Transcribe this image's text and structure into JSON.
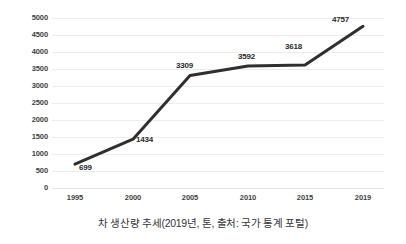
{
  "chart_data": {
    "type": "line",
    "title": "",
    "caption": "차 생산량 추세(2019년, 톤, 출처: 국가 통계 포털)",
    "xlabel": "",
    "ylabel": "",
    "categories": [
      "1995",
      "2000",
      "2005",
      "2010",
      "2015",
      "2019"
    ],
    "values": [
      699,
      1434,
      3309,
      3592,
      3618,
      4757
    ],
    "point_labels": [
      "699",
      "1434",
      "3309",
      "3592",
      "3618",
      "4757"
    ],
    "ylim": [
      0,
      5000
    ],
    "ytick_labels": [
      "5000",
      "4500",
      "4000",
      "3500",
      "3000",
      "2500",
      "2000",
      "1500",
      "1000",
      "500",
      "0"
    ],
    "ytick_values": [
      5000,
      4500,
      4000,
      3500,
      3000,
      2500,
      2000,
      1500,
      1000,
      500,
      0
    ],
    "grid": true,
    "legend": "none",
    "series": [
      {
        "name": "차 생산량",
        "values": [
          699,
          1434,
          3309,
          3592,
          3618,
          4757
        ],
        "color": "#2f2f2f"
      }
    ],
    "colors": {
      "line": "#2f2f2f",
      "grid": "#ececec",
      "text": "#3f3f3f",
      "background": "#ffffff"
    }
  }
}
